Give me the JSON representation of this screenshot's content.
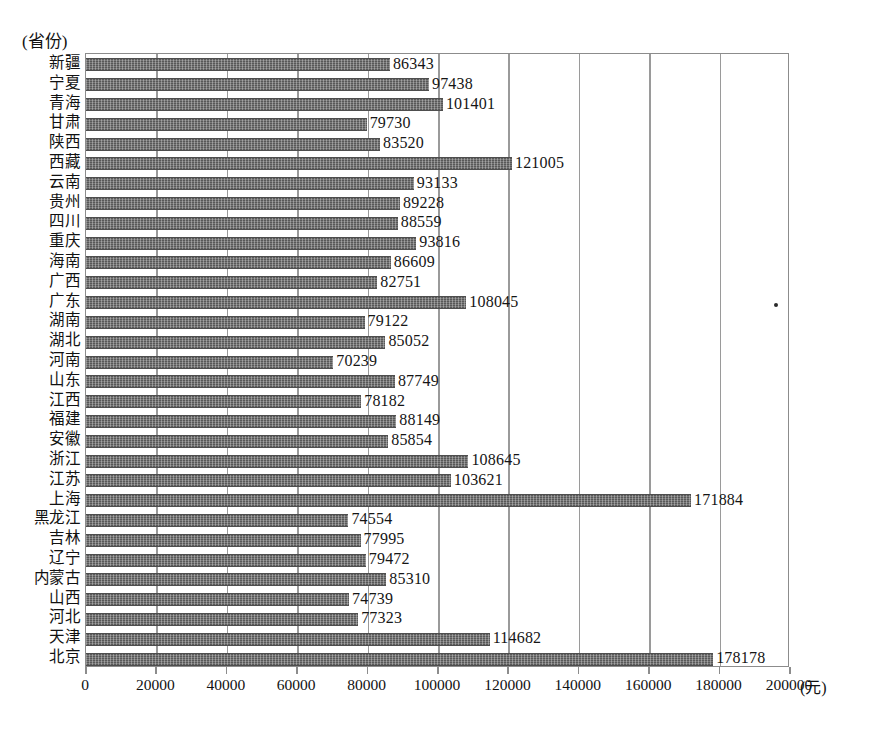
{
  "chart_data": {
    "type": "bar",
    "orientation": "horizontal",
    "title": "",
    "xlabel": "(元)",
    "ylabel": "(省份)",
    "xlim": [
      0,
      200000
    ],
    "xticks": [
      0,
      20000,
      40000,
      60000,
      80000,
      100000,
      120000,
      140000,
      160000,
      180000,
      200000
    ],
    "xtick_labels": [
      "0",
      "20000",
      "40000",
      "60000",
      "80000",
      "100000",
      "120000",
      "140000",
      "160000",
      "180000",
      "200000"
    ],
    "grid": "vertical",
    "legend": "none",
    "bar_color": "#6b6b6b",
    "categories": [
      "新疆",
      "宁夏",
      "青海",
      "甘肃",
      "陕西",
      "西藏",
      "云南",
      "贵州",
      "四川",
      "重庆",
      "海南",
      "广西",
      "广东",
      "湖南",
      "湖北",
      "河南",
      "山东",
      "江西",
      "福建",
      "安徽",
      "浙江",
      "江苏",
      "上海",
      "黑龙江",
      "吉林",
      "辽宁",
      "内蒙古",
      "山西",
      "河北",
      "天津",
      "北京"
    ],
    "values": [
      86343,
      97438,
      101401,
      79730,
      83520,
      121005,
      93133,
      89228,
      88559,
      93816,
      86609,
      82751,
      108045,
      79122,
      85052,
      70239,
      87749,
      78182,
      88149,
      85854,
      108645,
      103621,
      171884,
      74554,
      77995,
      79472,
      85310,
      74739,
      77323,
      114682,
      178178
    ],
    "value_labels": [
      "86343",
      "97438",
      "101401",
      "79730",
      "83520",
      "121005",
      "93133",
      "89228",
      "88559",
      "93816",
      "86609",
      "82751",
      "108045",
      "79122",
      "85052",
      "70239",
      "87749",
      "78182",
      "88149",
      "85854",
      "108645",
      "103621",
      "171884",
      "74554",
      "77995",
      "79472",
      "85310",
      "74739",
      "77323",
      "114682",
      "178178"
    ]
  },
  "axis": {
    "y_caption": "(省份)",
    "x_unit": "(元)"
  }
}
